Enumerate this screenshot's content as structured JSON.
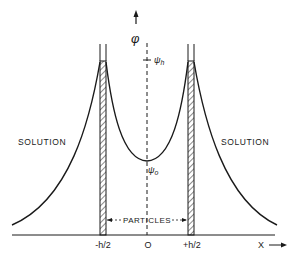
{
  "diagram": {
    "y_axis_label": "φ",
    "psi_h_label": "ψ",
    "psi_h_sub": "h",
    "psi_0_label": "ψ",
    "psi_0_sub": "o",
    "solution_left": "SOLUTION",
    "solution_right": "SOLUTION",
    "particles_label": "PARTICLES",
    "x_ticks": [
      "-h/2",
      "O",
      "+h/2"
    ],
    "x_axis_label": "X"
  },
  "colors": {
    "line": "#1a1a1a",
    "background": "#ffffff"
  }
}
